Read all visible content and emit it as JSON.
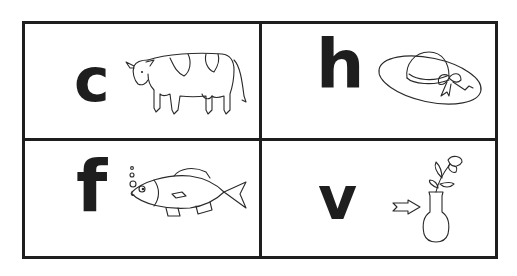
{
  "cards": [
    {
      "letter": "c",
      "picture": "cow"
    },
    {
      "letter": "h",
      "picture": "hat"
    },
    {
      "letter": "f",
      "picture": "fish"
    },
    {
      "letter": "v",
      "picture": "vase"
    }
  ],
  "colors": {
    "ink": "#1e1e1e",
    "background": "#ffffff"
  }
}
